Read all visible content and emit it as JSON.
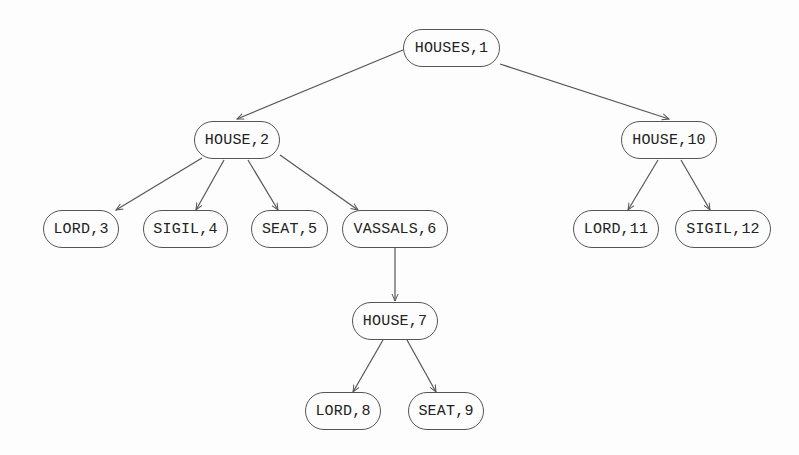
{
  "diagram": {
    "type": "tree",
    "nodes": [
      {
        "id": "n1",
        "label": "HOUSES,1",
        "x": 403,
        "y": 29,
        "w": 97
      },
      {
        "id": "n2",
        "label": "HOUSE,2",
        "x": 194,
        "y": 121,
        "w": 86
      },
      {
        "id": "n10",
        "label": "HOUSE,10",
        "x": 621,
        "y": 121,
        "w": 96
      },
      {
        "id": "n3",
        "label": "LORD,3",
        "x": 43,
        "y": 210,
        "w": 76
      },
      {
        "id": "n4",
        "label": "SIGIL,4",
        "x": 143,
        "y": 210,
        "w": 85
      },
      {
        "id": "n5",
        "label": "SEAT,5",
        "x": 251,
        "y": 210,
        "w": 77
      },
      {
        "id": "n6",
        "label": "VASSALS,6",
        "x": 342,
        "y": 210,
        "w": 106
      },
      {
        "id": "n11",
        "label": "LORD,11",
        "x": 573,
        "y": 210,
        "w": 86
      },
      {
        "id": "n12",
        "label": "SIGIL,12",
        "x": 675,
        "y": 210,
        "w": 96
      },
      {
        "id": "n7",
        "label": "HOUSE,7",
        "x": 352,
        "y": 302,
        "w": 86
      },
      {
        "id": "n8",
        "label": "LORD,8",
        "x": 305,
        "y": 392,
        "w": 76
      },
      {
        "id": "n9",
        "label": "SEAT,9",
        "x": 408,
        "y": 392,
        "w": 76
      }
    ],
    "edges": [
      {
        "from": "HOUSES,1",
        "to": "HOUSE,2",
        "x1": 403,
        "y1": 50,
        "x2": 237,
        "y2": 119
      },
      {
        "from": "HOUSES,1",
        "to": "HOUSE,10",
        "x1": 500,
        "y1": 64,
        "x2": 669,
        "y2": 119
      },
      {
        "from": "HOUSE,2",
        "to": "LORD,3",
        "x1": 202,
        "y1": 158,
        "x2": 116,
        "y2": 210
      },
      {
        "from": "HOUSE,2",
        "to": "SIGIL,4",
        "x1": 224,
        "y1": 160,
        "x2": 196,
        "y2": 210
      },
      {
        "from": "HOUSE,2",
        "to": "SEAT,5",
        "x1": 248,
        "y1": 160,
        "x2": 278,
        "y2": 210
      },
      {
        "from": "HOUSE,2",
        "to": "VASSALS,6",
        "x1": 280,
        "y1": 155,
        "x2": 358,
        "y2": 210
      },
      {
        "from": "HOUSE,10",
        "to": "LORD,11",
        "x1": 658,
        "y1": 160,
        "x2": 628,
        "y2": 210
      },
      {
        "from": "HOUSE,10",
        "to": "SIGIL,12",
        "x1": 681,
        "y1": 160,
        "x2": 710,
        "y2": 210
      },
      {
        "from": "VASSALS,6",
        "to": "HOUSE,7",
        "x1": 395,
        "y1": 248,
        "x2": 395,
        "y2": 301
      },
      {
        "from": "HOUSE,7",
        "to": "LORD,8",
        "x1": 383,
        "y1": 340,
        "x2": 353,
        "y2": 392
      },
      {
        "from": "HOUSE,7",
        "to": "SEAT,9",
        "x1": 407,
        "y1": 340,
        "x2": 436,
        "y2": 392
      }
    ],
    "colors": {
      "stroke": "#555555",
      "text": "#222222",
      "background": "#fdfdfd"
    }
  }
}
